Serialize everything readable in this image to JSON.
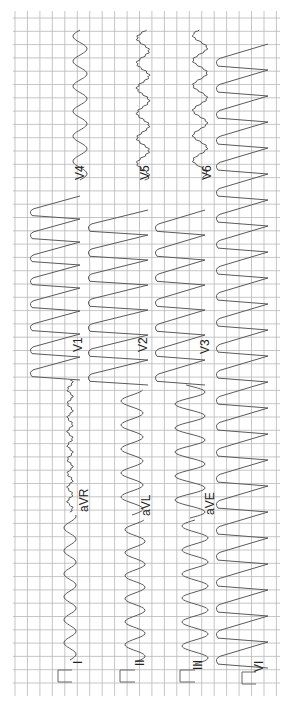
{
  "chart_data": {
    "type": "line",
    "title": "",
    "orientation": "rotated-90-ccw",
    "grid": true,
    "grid_color": "#b8b8b8",
    "trace_color": "#555555",
    "background": "#ffffff",
    "layout": "3x4 + rhythm strip",
    "leads": [
      {
        "name": "I",
        "row": 1,
        "col": 1
      },
      {
        "name": "aVR",
        "row": 1,
        "col": 2
      },
      {
        "name": "V1",
        "row": 1,
        "col": 3
      },
      {
        "name": "V4",
        "row": 1,
        "col": 4
      },
      {
        "name": "II",
        "row": 2,
        "col": 1
      },
      {
        "name": "aVL",
        "row": 2,
        "col": 2
      },
      {
        "name": "V2",
        "row": 2,
        "col": 3
      },
      {
        "name": "V5",
        "row": 2,
        "col": 4
      },
      {
        "name": "III",
        "row": 3,
        "col": 1
      },
      {
        "name": "aVF",
        "row": 3,
        "col": 2
      },
      {
        "name": "V3",
        "row": 3,
        "col": 3
      },
      {
        "name": "V6",
        "row": 3,
        "col": 4
      },
      {
        "name": "VI",
        "row": 4,
        "col": "rhythm"
      }
    ],
    "rhythm": "wide-complex tachycardia",
    "xlabel": "",
    "ylabel": ""
  },
  "labels": {
    "I": "I",
    "II": "II",
    "III": "III",
    "VI": "VI",
    "aVR": "aVR",
    "aVL": "aVL",
    "aVF": "aVE",
    "V1": "V1",
    "V2": "V2",
    "V3": "V3",
    "V4": "V4",
    "V5": "V5",
    "V6": "V6"
  }
}
